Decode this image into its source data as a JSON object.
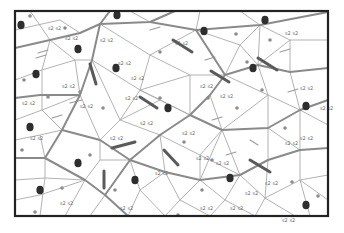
{
  "diagram": {
    "type": "triangulated-mesh",
    "background": "#ffffff",
    "frame": {
      "x": 15,
      "y": 11,
      "w": 313,
      "h": 205,
      "stroke": "#222222",
      "width": 2.2
    },
    "colors": {
      "thin_line": "#a9a9a9",
      "thick_line": "#8a8a8a",
      "blob": "#2e2e2e",
      "dot": "#8c8c8c",
      "bar": "#5a5a5a",
      "hatch": "#9a9a9a",
      "glyph": "#6a6a6a"
    },
    "thick_lines": [
      [
        [
          15,
          48
        ],
        [
          50,
          40
        ],
        [
          80,
          33
        ],
        [
          100,
          24
        ],
        [
          110,
          11
        ]
      ],
      [
        [
          100,
          24
        ],
        [
          150,
          22
        ],
        [
          175,
          11
        ]
      ],
      [
        [
          100,
          24
        ],
        [
          92,
          60
        ],
        [
          80,
          95
        ],
        [
          62,
          130
        ],
        [
          45,
          158
        ],
        [
          15,
          158
        ]
      ],
      [
        [
          45,
          158
        ],
        [
          85,
          180
        ],
        [
          105,
          195
        ],
        [
          128,
          216
        ]
      ],
      [
        [
          105,
          195
        ],
        [
          130,
          160
        ],
        [
          160,
          135
        ],
        [
          190,
          115
        ],
        [
          210,
          95
        ],
        [
          225,
          75
        ],
        [
          258,
          65
        ],
        [
          290,
          72
        ],
        [
          328,
          68
        ]
      ],
      [
        [
          150,
          22
        ],
        [
          196,
          30
        ],
        [
          225,
          75
        ]
      ],
      [
        [
          196,
          30
        ],
        [
          260,
          25
        ],
        [
          328,
          12
        ]
      ],
      [
        [
          190,
          115
        ],
        [
          222,
          130
        ],
        [
          268,
          128
        ],
        [
          300,
          110
        ],
        [
          328,
          100
        ]
      ],
      [
        [
          130,
          160
        ],
        [
          165,
          172
        ],
        [
          200,
          180
        ],
        [
          240,
          175
        ],
        [
          268,
          160
        ],
        [
          300,
          150
        ],
        [
          328,
          148
        ]
      ],
      [
        [
          62,
          130
        ],
        [
          100,
          140
        ],
        [
          130,
          160
        ]
      ],
      [
        [
          15,
          98
        ],
        [
          40,
          95
        ],
        [
          80,
          95
        ]
      ]
    ],
    "thin_lines": [
      [
        [
          15,
          30
        ],
        [
          60,
          20
        ],
        [
          80,
          33
        ]
      ],
      [
        [
          30,
          11
        ],
        [
          50,
          40
        ],
        [
          42,
          70
        ],
        [
          15,
          80
        ]
      ],
      [
        [
          50,
          40
        ],
        [
          75,
          60
        ],
        [
          92,
          60
        ]
      ],
      [
        [
          42,
          70
        ],
        [
          75,
          60
        ],
        [
          80,
          95
        ]
      ],
      [
        [
          15,
          120
        ],
        [
          42,
          110
        ],
        [
          62,
          130
        ]
      ],
      [
        [
          42,
          110
        ],
        [
          42,
          70
        ]
      ],
      [
        [
          42,
          110
        ],
        [
          80,
          95
        ]
      ],
      [
        [
          15,
          140
        ],
        [
          40,
          135
        ],
        [
          62,
          130
        ]
      ],
      [
        [
          40,
          135
        ],
        [
          45,
          158
        ]
      ],
      [
        [
          15,
          180
        ],
        [
          45,
          178
        ],
        [
          45,
          158
        ]
      ],
      [
        [
          45,
          178
        ],
        [
          40,
          216
        ]
      ],
      [
        [
          45,
          178
        ],
        [
          85,
          180
        ]
      ],
      [
        [
          15,
          200
        ],
        [
          40,
          195
        ],
        [
          85,
          180
        ]
      ],
      [
        [
          65,
          216
        ],
        [
          85,
          180
        ]
      ],
      [
        [
          90,
          216
        ],
        [
          105,
          195
        ]
      ],
      [
        [
          85,
          180
        ],
        [
          100,
          160
        ],
        [
          130,
          160
        ]
      ],
      [
        [
          100,
          160
        ],
        [
          100,
          140
        ]
      ],
      [
        [
          100,
          140
        ],
        [
          120,
          120
        ],
        [
          160,
          135
        ]
      ],
      [
        [
          120,
          120
        ],
        [
          92,
          60
        ]
      ],
      [
        [
          120,
          120
        ],
        [
          140,
          90
        ],
        [
          190,
          115
        ]
      ],
      [
        [
          140,
          90
        ],
        [
          92,
          60
        ]
      ],
      [
        [
          140,
          90
        ],
        [
          150,
          55
        ],
        [
          100,
          24
        ]
      ],
      [
        [
          150,
          55
        ],
        [
          196,
          30
        ]
      ],
      [
        [
          150,
          55
        ],
        [
          190,
          75
        ],
        [
          225,
          75
        ]
      ],
      [
        [
          190,
          75
        ],
        [
          190,
          115
        ]
      ],
      [
        [
          190,
          75
        ],
        [
          140,
          90
        ]
      ],
      [
        [
          120,
          120
        ],
        [
          160,
          100
        ],
        [
          190,
          115
        ]
      ],
      [
        [
          150,
          22
        ],
        [
          130,
          11
        ]
      ],
      [
        [
          196,
          30
        ],
        [
          200,
          11
        ]
      ],
      [
        [
          260,
          25
        ],
        [
          240,
          11
        ]
      ],
      [
        [
          260,
          25
        ],
        [
          290,
          40
        ],
        [
          328,
          40
        ]
      ],
      [
        [
          290,
          40
        ],
        [
          290,
          72
        ]
      ],
      [
        [
          260,
          25
        ],
        [
          258,
          65
        ]
      ],
      [
        [
          290,
          40
        ],
        [
          258,
          65
        ]
      ],
      [
        [
          225,
          75
        ],
        [
          240,
          45
        ],
        [
          260,
          25
        ]
      ],
      [
        [
          240,
          45
        ],
        [
          196,
          30
        ]
      ],
      [
        [
          240,
          45
        ],
        [
          258,
          65
        ]
      ],
      [
        [
          290,
          72
        ],
        [
          300,
          110
        ]
      ],
      [
        [
          258,
          65
        ],
        [
          268,
          95
        ],
        [
          300,
          110
        ]
      ],
      [
        [
          268,
          95
        ],
        [
          225,
          75
        ]
      ],
      [
        [
          268,
          95
        ],
        [
          268,
          128
        ]
      ],
      [
        [
          268,
          95
        ],
        [
          222,
          130
        ]
      ],
      [
        [
          222,
          130
        ],
        [
          210,
          95
        ]
      ],
      [
        [
          328,
          125
        ],
        [
          300,
          110
        ]
      ],
      [
        [
          300,
          110
        ],
        [
          300,
          150
        ]
      ],
      [
        [
          268,
          128
        ],
        [
          300,
          150
        ]
      ],
      [
        [
          268,
          128
        ],
        [
          268,
          160
        ]
      ],
      [
        [
          222,
          130
        ],
        [
          240,
          175
        ]
      ],
      [
        [
          222,
          130
        ],
        [
          200,
          180
        ]
      ],
      [
        [
          160,
          135
        ],
        [
          165,
          172
        ]
      ],
      [
        [
          160,
          135
        ],
        [
          200,
          155
        ],
        [
          222,
          130
        ]
      ],
      [
        [
          200,
          155
        ],
        [
          200,
          180
        ]
      ],
      [
        [
          200,
          155
        ],
        [
          240,
          175
        ]
      ],
      [
        [
          130,
          160
        ],
        [
          140,
          190
        ],
        [
          165,
          172
        ]
      ],
      [
        [
          140,
          190
        ],
        [
          128,
          216
        ]
      ],
      [
        [
          140,
          190
        ],
        [
          165,
          216
        ]
      ],
      [
        [
          165,
          172
        ],
        [
          180,
          200
        ],
        [
          200,
          180
        ]
      ],
      [
        [
          180,
          200
        ],
        [
          165,
          216
        ]
      ],
      [
        [
          180,
          200
        ],
        [
          210,
          216
        ]
      ],
      [
        [
          200,
          180
        ],
        [
          225,
          200
        ],
        [
          240,
          175
        ]
      ],
      [
        [
          225,
          200
        ],
        [
          210,
          216
        ]
      ],
      [
        [
          225,
          200
        ],
        [
          255,
          216
        ]
      ],
      [
        [
          240,
          175
        ],
        [
          265,
          198
        ],
        [
          268,
          160
        ]
      ],
      [
        [
          265,
          198
        ],
        [
          255,
          216
        ]
      ],
      [
        [
          265,
          198
        ],
        [
          295,
          216
        ]
      ],
      [
        [
          265,
          198
        ],
        [
          300,
          180
        ],
        [
          300,
          150
        ]
      ],
      [
        [
          300,
          180
        ],
        [
          328,
          175
        ]
      ],
      [
        [
          300,
          180
        ],
        [
          310,
          216
        ]
      ],
      [
        [
          300,
          180
        ],
        [
          328,
          200
        ]
      ],
      [
        [
          85,
          180
        ],
        [
          105,
          195
        ]
      ],
      [
        [
          100,
          140
        ],
        [
          80,
          95
        ]
      ],
      [
        [
          160,
          100
        ],
        [
          140,
          90
        ]
      ]
    ],
    "blobs": [
      [
        21,
        25
      ],
      [
        36,
        74
      ],
      [
        78,
        49
      ],
      [
        116,
        68
      ],
      [
        30,
        127
      ],
      [
        40,
        190
      ],
      [
        78,
        163
      ],
      [
        117,
        15
      ],
      [
        204,
        31
      ],
      [
        168,
        108
      ],
      [
        230,
        178
      ],
      [
        306,
        106
      ],
      [
        306,
        205
      ],
      [
        253,
        68
      ],
      [
        265,
        20
      ],
      [
        135,
        180
      ]
    ],
    "dots": [
      [
        30,
        16
      ],
      [
        65,
        28
      ],
      [
        24,
        80
      ],
      [
        48,
        97
      ],
      [
        80,
        92
      ],
      [
        22,
        150
      ],
      [
        62,
        188
      ],
      [
        35,
        212
      ],
      [
        103,
        108
      ],
      [
        90,
        155
      ],
      [
        115,
        190
      ],
      [
        160,
        52
      ],
      [
        236,
        34
      ],
      [
        247,
        62
      ],
      [
        270,
        40
      ],
      [
        262,
        90
      ],
      [
        285,
        128
      ],
      [
        237,
        108
      ],
      [
        202,
        190
      ],
      [
        208,
        98
      ],
      [
        160,
        98
      ],
      [
        184,
        142
      ],
      [
        318,
        196
      ],
      [
        212,
        160
      ],
      [
        178,
        215
      ],
      [
        292,
        182
      ]
    ],
    "bars": [
      [
        [
          90,
          64
        ],
        [
          96,
          84
        ]
      ],
      [
        [
          140,
          97
        ],
        [
          157,
          108
        ]
      ],
      [
        [
          173,
          40
        ],
        [
          192,
          52
        ]
      ],
      [
        [
          211,
          71
        ],
        [
          229,
          82
        ]
      ],
      [
        [
          258,
          58
        ],
        [
          277,
          70
        ]
      ],
      [
        [
          112,
          148
        ],
        [
          135,
          142
        ]
      ],
      [
        [
          164,
          150
        ],
        [
          178,
          165
        ]
      ],
      [
        [
          104,
          171
        ],
        [
          104,
          188
        ]
      ],
      [
        [
          250,
          160
        ],
        [
          270,
          172
        ]
      ]
    ],
    "hatches": [
      [
        [
          38,
          53
        ],
        [
          48,
          50
        ]
      ],
      [
        [
          36,
          58
        ],
        [
          46,
          55
        ]
      ],
      [
        [
          52,
          118
        ],
        [
          62,
          115
        ]
      ],
      [
        [
          70,
          103
        ],
        [
          82,
          100
        ]
      ],
      [
        [
          205,
          60
        ],
        [
          215,
          57
        ]
      ],
      [
        [
          280,
          52
        ],
        [
          290,
          49
        ]
      ],
      [
        [
          212,
          120
        ],
        [
          222,
          117
        ]
      ],
      [
        [
          226,
          155
        ],
        [
          236,
          152
        ]
      ],
      [
        [
          250,
          140
        ],
        [
          258,
          145
        ]
      ],
      [
        [
          288,
          92
        ],
        [
          298,
          89
        ]
      ],
      [
        [
          150,
          30
        ],
        [
          160,
          27
        ]
      ]
    ],
    "glyphs": [
      [
        48,
        30
      ],
      [
        65,
        40
      ],
      [
        100,
        42
      ],
      [
        118,
        65
      ],
      [
        62,
        88
      ],
      [
        80,
        108
      ],
      [
        22,
        105
      ],
      [
        30,
        140
      ],
      [
        175,
        45
      ],
      [
        131,
        80
      ],
      [
        125,
        100
      ],
      [
        200,
        88
      ],
      [
        220,
        98
      ],
      [
        110,
        140
      ],
      [
        140,
        125
      ],
      [
        155,
        175
      ],
      [
        182,
        135
      ],
      [
        196,
        160
      ],
      [
        216,
        165
      ],
      [
        245,
        195
      ],
      [
        265,
        185
      ],
      [
        285,
        145
      ],
      [
        300,
        140
      ],
      [
        282,
        222
      ],
      [
        230,
        210
      ],
      [
        200,
        210
      ],
      [
        120,
        210
      ],
      [
        60,
        205
      ],
      [
        285,
        35
      ],
      [
        300,
        90
      ],
      [
        320,
        110
      ]
    ],
    "glyph_text": "s2"
  }
}
